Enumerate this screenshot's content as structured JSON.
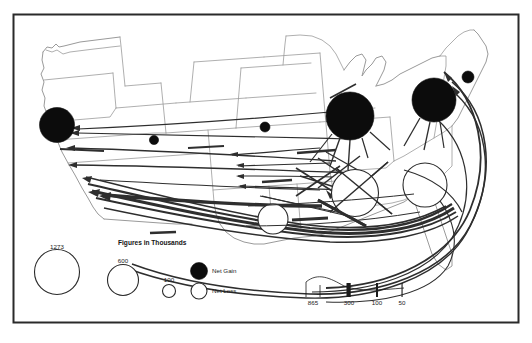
{
  "figure": {
    "units_note": "Figures in Thousands",
    "frame_color": "#2a2a2a",
    "background_color": "#ffffff"
  },
  "legend": {
    "units_label": "Figures in Thousands",
    "circle_sizes": [
      {
        "value": "1273",
        "label": "1273",
        "radius_px": 22.5,
        "cx": 57,
        "cy": 272,
        "style": "open"
      },
      {
        "value": "600",
        "label": "600",
        "radius_px": 15.5,
        "cx": 123,
        "cy": 280,
        "style": "open"
      },
      {
        "value": "100",
        "label": "100",
        "radius_px": 6.5,
        "cx": 169,
        "cy": 291,
        "style": "open"
      }
    ],
    "symbols": [
      {
        "key": "net-gain",
        "label": "Net Gain",
        "fill": "#0c0c0c",
        "cx": 199,
        "cy": 272,
        "radius_px": 8.5
      },
      {
        "key": "net-loss",
        "label": "Net Loss",
        "fill": "#ffffff",
        "cx": 199,
        "cy": 291,
        "radius_px": 8.0
      }
    ],
    "flow_widths": [
      {
        "value": "865",
        "label": "865",
        "width_px": 11.5,
        "x": 313
      },
      {
        "value": "300",
        "label": "300",
        "width_px": 4.2,
        "x": 349
      },
      {
        "value": "100",
        "label": "100",
        "width_px": 2.0,
        "x": 377
      },
      {
        "value": "50",
        "label": "50",
        "width_px": 1.1,
        "x": 402
      }
    ],
    "flow_axis_y": 295,
    "flow_label_y": 303
  },
  "map": {
    "net_gain_circles": [
      {
        "name": "california",
        "cx": 57,
        "cy": 125,
        "r": 17.5
      },
      {
        "name": "arizona",
        "cx": 154,
        "cy": 140,
        "r": 4.6
      },
      {
        "name": "texas-north",
        "cx": 265,
        "cy": 127,
        "r": 5.0
      },
      {
        "name": "great-lakes",
        "cx": 350,
        "cy": 116,
        "r": 24.0
      },
      {
        "name": "new-york",
        "cx": 434,
        "cy": 100,
        "r": 22.0
      },
      {
        "name": "new-england",
        "cx": 468,
        "cy": 77,
        "r": 6.0
      }
    ],
    "net_loss_circles": [
      {
        "name": "south-central",
        "cx": 273,
        "cy": 219,
        "r": 15.0
      },
      {
        "name": "mid-south",
        "cx": 355,
        "cy": 193,
        "r": 23.5
      },
      {
        "name": "southeast",
        "cx": 425,
        "cy": 185,
        "r": 22.0
      }
    ]
  }
}
